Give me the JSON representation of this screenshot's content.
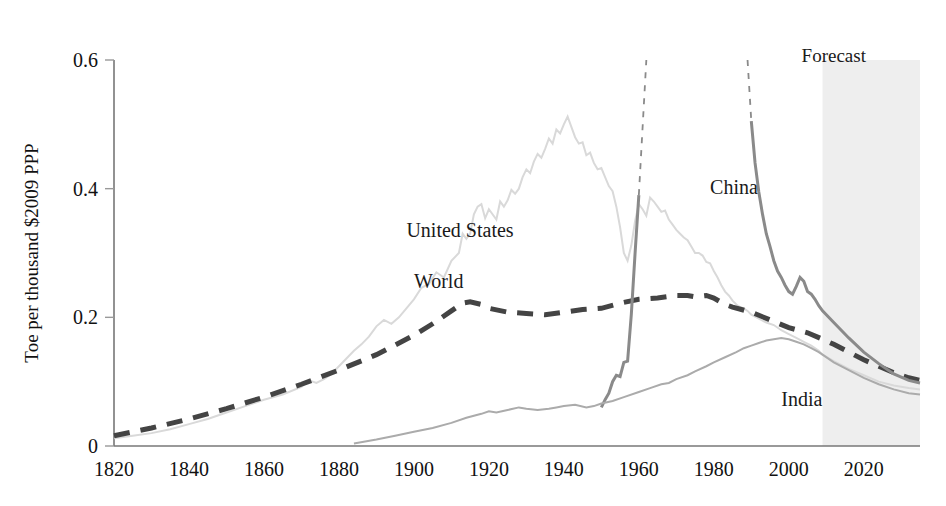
{
  "chart_data": {
    "type": "line",
    "title": "",
    "xlabel": "",
    "ylabel": "Toe per thousand $2009 PPP",
    "xlim": [
      1820,
      2035
    ],
    "ylim": [
      0,
      0.6
    ],
    "grid": false,
    "legend": "inline-labels",
    "x_ticks": [
      "1820",
      "1840",
      "1860",
      "1880",
      "1900",
      "1920",
      "1940",
      "1960",
      "1980",
      "2000",
      "2020"
    ],
    "x_tick_values": [
      1820,
      1840,
      1860,
      1880,
      1900,
      1920,
      1940,
      1960,
      1980,
      2000,
      2020
    ],
    "y_ticks": [
      "0",
      "0.2",
      "0.4",
      "0.6"
    ],
    "y_tick_values": [
      0,
      0.2,
      0.4,
      0.6
    ],
    "annotations": [
      {
        "text": "Forecast",
        "x": 2012,
        "y": 0.585,
        "region_start": 2009,
        "region_end": 2035
      }
    ],
    "series": [
      {
        "name": "United States",
        "color": "#d9d9d9",
        "style": "solid",
        "label_x": 1898,
        "label_y": 0.325,
        "points": [
          [
            1820,
            0.012
          ],
          [
            1825,
            0.016
          ],
          [
            1830,
            0.02
          ],
          [
            1835,
            0.026
          ],
          [
            1840,
            0.034
          ],
          [
            1845,
            0.042
          ],
          [
            1850,
            0.052
          ],
          [
            1855,
            0.062
          ],
          [
            1860,
            0.072
          ],
          [
            1865,
            0.08
          ],
          [
            1870,
            0.092
          ],
          [
            1872,
            0.102
          ],
          [
            1874,
            0.098
          ],
          [
            1876,
            0.104
          ],
          [
            1878,
            0.112
          ],
          [
            1880,
            0.124
          ],
          [
            1882,
            0.136
          ],
          [
            1884,
            0.148
          ],
          [
            1886,
            0.158
          ],
          [
            1888,
            0.17
          ],
          [
            1890,
            0.186
          ],
          [
            1892,
            0.196
          ],
          [
            1894,
            0.19
          ],
          [
            1896,
            0.2
          ],
          [
            1898,
            0.214
          ],
          [
            1900,
            0.228
          ],
          [
            1902,
            0.246
          ],
          [
            1904,
            0.252
          ],
          [
            1906,
            0.27
          ],
          [
            1908,
            0.262
          ],
          [
            1910,
            0.288
          ],
          [
            1912,
            0.3
          ],
          [
            1913,
            0.33
          ],
          [
            1914,
            0.322
          ],
          [
            1915,
            0.33
          ],
          [
            1916,
            0.36
          ],
          [
            1917,
            0.372
          ],
          [
            1918,
            0.376
          ],
          [
            1919,
            0.354
          ],
          [
            1920,
            0.368
          ],
          [
            1922,
            0.352
          ],
          [
            1923,
            0.38
          ],
          [
            1924,
            0.372
          ],
          [
            1925,
            0.382
          ],
          [
            1926,
            0.398
          ],
          [
            1927,
            0.392
          ],
          [
            1928,
            0.4
          ],
          [
            1929,
            0.418
          ],
          [
            1930,
            0.43
          ],
          [
            1931,
            0.424
          ],
          [
            1932,
            0.442
          ],
          [
            1933,
            0.454
          ],
          [
            1934,
            0.448
          ],
          [
            1935,
            0.462
          ],
          [
            1936,
            0.478
          ],
          [
            1937,
            0.47
          ],
          [
            1938,
            0.492
          ],
          [
            1939,
            0.486
          ],
          [
            1940,
            0.5
          ],
          [
            1941,
            0.512
          ],
          [
            1942,
            0.496
          ],
          [
            1943,
            0.48
          ],
          [
            1944,
            0.47
          ],
          [
            1945,
            0.472
          ],
          [
            1946,
            0.452
          ],
          [
            1947,
            0.456
          ],
          [
            1948,
            0.44
          ],
          [
            1949,
            0.43
          ],
          [
            1950,
            0.432
          ],
          [
            1951,
            0.418
          ],
          [
            1952,
            0.404
          ],
          [
            1953,
            0.396
          ],
          [
            1954,
            0.372
          ],
          [
            1955,
            0.34
          ],
          [
            1956,
            0.3
          ],
          [
            1957,
            0.288
          ],
          [
            1958,
            0.312
          ],
          [
            1959,
            0.35
          ],
          [
            1960,
            0.376
          ],
          [
            1961,
            0.368
          ],
          [
            1962,
            0.358
          ],
          [
            1963,
            0.386
          ],
          [
            1964,
            0.38
          ],
          [
            1965,
            0.372
          ],
          [
            1966,
            0.364
          ],
          [
            1967,
            0.366
          ],
          [
            1968,
            0.352
          ],
          [
            1969,
            0.344
          ],
          [
            1970,
            0.336
          ],
          [
            1971,
            0.33
          ],
          [
            1972,
            0.324
          ],
          [
            1973,
            0.32
          ],
          [
            1974,
            0.31
          ],
          [
            1975,
            0.3
          ],
          [
            1976,
            0.3
          ],
          [
            1977,
            0.296
          ],
          [
            1978,
            0.286
          ],
          [
            1979,
            0.284
          ],
          [
            1980,
            0.272
          ],
          [
            1981,
            0.262
          ],
          [
            1982,
            0.25
          ],
          [
            1983,
            0.24
          ],
          [
            1984,
            0.234
          ],
          [
            1985,
            0.226
          ],
          [
            1986,
            0.22
          ],
          [
            1987,
            0.216
          ],
          [
            1988,
            0.214
          ],
          [
            1989,
            0.21
          ],
          [
            1990,
            0.204
          ],
          [
            1992,
            0.198
          ],
          [
            1994,
            0.192
          ],
          [
            1996,
            0.188
          ],
          [
            1998,
            0.18
          ],
          [
            2000,
            0.174
          ],
          [
            2002,
            0.168
          ],
          [
            2004,
            0.162
          ],
          [
            2006,
            0.156
          ],
          [
            2008,
            0.148
          ],
          [
            2009,
            0.142
          ],
          [
            2012,
            0.132
          ],
          [
            2016,
            0.12
          ],
          [
            2020,
            0.11
          ],
          [
            2024,
            0.1
          ],
          [
            2028,
            0.094
          ],
          [
            2032,
            0.09
          ],
          [
            2035,
            0.088
          ]
        ]
      },
      {
        "name": "World",
        "color": "#444444",
        "style": "dashed",
        "label_x": 1900,
        "label_y": 0.245,
        "points": [
          [
            1820,
            0.016
          ],
          [
            1830,
            0.028
          ],
          [
            1840,
            0.042
          ],
          [
            1850,
            0.058
          ],
          [
            1860,
            0.076
          ],
          [
            1870,
            0.096
          ],
          [
            1880,
            0.118
          ],
          [
            1890,
            0.142
          ],
          [
            1900,
            0.172
          ],
          [
            1905,
            0.19
          ],
          [
            1910,
            0.21
          ],
          [
            1913,
            0.222
          ],
          [
            1915,
            0.224
          ],
          [
            1918,
            0.22
          ],
          [
            1920,
            0.214
          ],
          [
            1925,
            0.208
          ],
          [
            1930,
            0.206
          ],
          [
            1935,
            0.204
          ],
          [
            1940,
            0.208
          ],
          [
            1945,
            0.212
          ],
          [
            1950,
            0.214
          ],
          [
            1955,
            0.222
          ],
          [
            1960,
            0.228
          ],
          [
            1965,
            0.23
          ],
          [
            1970,
            0.234
          ],
          [
            1973,
            0.234
          ],
          [
            1975,
            0.232
          ],
          [
            1978,
            0.234
          ],
          [
            1980,
            0.23
          ],
          [
            1983,
            0.22
          ],
          [
            1985,
            0.216
          ],
          [
            1990,
            0.208
          ],
          [
            1995,
            0.196
          ],
          [
            2000,
            0.184
          ],
          [
            2005,
            0.176
          ],
          [
            2009,
            0.166
          ],
          [
            2012,
            0.158
          ],
          [
            2016,
            0.146
          ],
          [
            2020,
            0.134
          ],
          [
            2024,
            0.124
          ],
          [
            2028,
            0.114
          ],
          [
            2032,
            0.106
          ],
          [
            2035,
            0.102
          ]
        ]
      },
      {
        "name": "China",
        "color": "#8a8a8a",
        "style": "solid-with-offscale-dashes",
        "label_x": 1979,
        "label_y": 0.392,
        "points": [
          [
            1950,
            0.06
          ],
          [
            1951,
            0.072
          ],
          [
            1952,
            0.082
          ],
          [
            1953,
            0.1
          ],
          [
            1954,
            0.11
          ],
          [
            1955,
            0.108
          ],
          [
            1956,
            0.13
          ],
          [
            1957,
            0.132
          ],
          [
            1958,
            0.205
          ],
          [
            1959,
            0.3
          ],
          [
            1960,
            0.39
          ]
        ],
        "offscale_rise": [
          [
            1960,
            0.39
          ],
          [
            1962,
            0.6
          ],
          [
            1964,
            0.76
          ]
        ],
        "offscale_fall": [
          [
            1987,
            0.76
          ],
          [
            1989,
            0.6
          ],
          [
            1990,
            0.505
          ]
        ],
        "points_after": [
          [
            1990,
            0.505
          ],
          [
            1991,
            0.44
          ],
          [
            1992,
            0.395
          ],
          [
            1993,
            0.36
          ],
          [
            1994,
            0.33
          ],
          [
            1995,
            0.31
          ],
          [
            1996,
            0.288
          ],
          [
            1997,
            0.272
          ],
          [
            1998,
            0.262
          ],
          [
            1999,
            0.25
          ],
          [
            2000,
            0.24
          ],
          [
            2001,
            0.236
          ],
          [
            2002,
            0.248
          ],
          [
            2003,
            0.262
          ],
          [
            2004,
            0.256
          ],
          [
            2005,
            0.24
          ],
          [
            2006,
            0.236
          ],
          [
            2007,
            0.228
          ],
          [
            2008,
            0.218
          ],
          [
            2009,
            0.21
          ],
          [
            2012,
            0.192
          ],
          [
            2016,
            0.168
          ],
          [
            2020,
            0.146
          ],
          [
            2024,
            0.128
          ],
          [
            2028,
            0.112
          ],
          [
            2032,
            0.102
          ],
          [
            2035,
            0.098
          ]
        ]
      },
      {
        "name": "India",
        "color": "#ababab",
        "style": "solid",
        "label_x": 1998,
        "label_y": 0.062,
        "points": [
          [
            1884,
            0.004
          ],
          [
            1890,
            0.01
          ],
          [
            1895,
            0.016
          ],
          [
            1900,
            0.022
          ],
          [
            1905,
            0.028
          ],
          [
            1910,
            0.036
          ],
          [
            1914,
            0.044
          ],
          [
            1918,
            0.05
          ],
          [
            1920,
            0.054
          ],
          [
            1922,
            0.052
          ],
          [
            1925,
            0.056
          ],
          [
            1928,
            0.06
          ],
          [
            1930,
            0.058
          ],
          [
            1933,
            0.056
          ],
          [
            1936,
            0.058
          ],
          [
            1938,
            0.06
          ],
          [
            1940,
            0.062
          ],
          [
            1943,
            0.064
          ],
          [
            1946,
            0.06
          ],
          [
            1948,
            0.062
          ],
          [
            1950,
            0.066
          ],
          [
            1953,
            0.07
          ],
          [
            1956,
            0.076
          ],
          [
            1960,
            0.084
          ],
          [
            1963,
            0.09
          ],
          [
            1966,
            0.096
          ],
          [
            1968,
            0.098
          ],
          [
            1970,
            0.104
          ],
          [
            1973,
            0.11
          ],
          [
            1975,
            0.116
          ],
          [
            1978,
            0.124
          ],
          [
            1980,
            0.13
          ],
          [
            1983,
            0.138
          ],
          [
            1986,
            0.146
          ],
          [
            1988,
            0.152
          ],
          [
            1990,
            0.156
          ],
          [
            1992,
            0.16
          ],
          [
            1994,
            0.164
          ],
          [
            1996,
            0.166
          ],
          [
            1998,
            0.168
          ],
          [
            2000,
            0.166
          ],
          [
            2002,
            0.162
          ],
          [
            2004,
            0.158
          ],
          [
            2006,
            0.152
          ],
          [
            2008,
            0.146
          ],
          [
            2009,
            0.142
          ],
          [
            2012,
            0.13
          ],
          [
            2016,
            0.118
          ],
          [
            2020,
            0.106
          ],
          [
            2024,
            0.096
          ],
          [
            2028,
            0.088
          ],
          [
            2032,
            0.082
          ],
          [
            2035,
            0.08
          ]
        ]
      }
    ],
    "colors": {
      "forecast_band": "#eeeeee",
      "axis": "#777777",
      "text": "#111111"
    }
  }
}
